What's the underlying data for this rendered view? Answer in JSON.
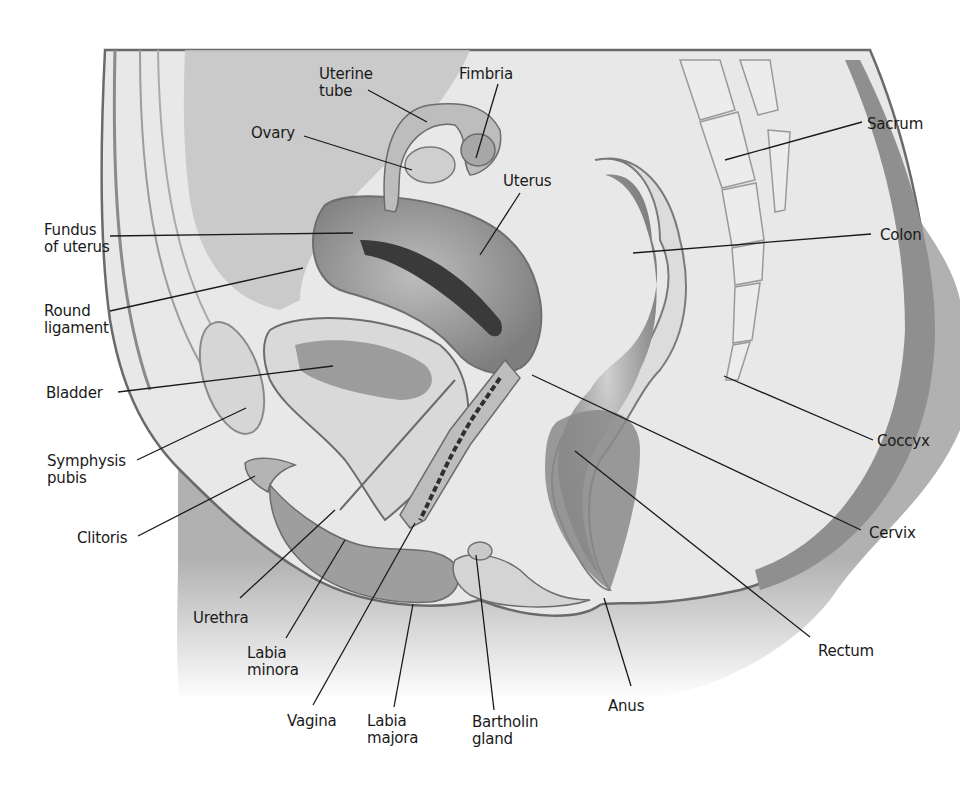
{
  "diagram": {
    "type": "anatomical-illustration",
    "colors": {
      "background": "#ffffff",
      "skin_dark": "#8f8f8f",
      "skin_mid": "#b5b5b5",
      "tissue_light": "#e6e6e6",
      "organ_mid": "#a9a9a9",
      "organ_dark": "#6f6f6f",
      "line": "#1a1a1a"
    },
    "labels": [
      {
        "id": "uterine-tube",
        "text": "Uterine\ntube",
        "x": 319,
        "y": 66,
        "align": "left",
        "line": [
          [
            368,
            90
          ],
          [
            427,
            122
          ]
        ]
      },
      {
        "id": "fimbria",
        "text": "Fimbria",
        "x": 459,
        "y": 66,
        "align": "left",
        "line": [
          [
            498,
            84
          ],
          [
            476,
            158
          ]
        ]
      },
      {
        "id": "ovary",
        "text": "Ovary",
        "x": 251,
        "y": 125,
        "align": "left",
        "line": [
          [
            304,
            136
          ],
          [
            412,
            170
          ]
        ]
      },
      {
        "id": "uterus",
        "text": "Uterus",
        "x": 503,
        "y": 173,
        "align": "left",
        "line": [
          [
            520,
            193
          ],
          [
            480,
            255
          ]
        ]
      },
      {
        "id": "sacrum",
        "text": "Sacrum",
        "x": 867,
        "y": 116,
        "align": "left",
        "line": [
          [
            862,
            122
          ],
          [
            725,
            160
          ]
        ]
      },
      {
        "id": "fundus-of-uterus",
        "text": "Fundus\nof uterus",
        "x": 44,
        "y": 222,
        "align": "left",
        "line": [
          [
            110,
            236
          ],
          [
            353,
            233
          ]
        ]
      },
      {
        "id": "colon",
        "text": "Colon",
        "x": 880,
        "y": 227,
        "align": "left",
        "line": [
          [
            871,
            234
          ],
          [
            633,
            253
          ]
        ]
      },
      {
        "id": "round-ligament",
        "text": "Round\nligament",
        "x": 44,
        "y": 303,
        "align": "left",
        "line": [
          [
            110,
            311
          ],
          [
            303,
            268
          ]
        ]
      },
      {
        "id": "bladder",
        "text": "Bladder",
        "x": 46,
        "y": 385,
        "align": "left",
        "line": [
          [
            118,
            392
          ],
          [
            333,
            366
          ]
        ]
      },
      {
        "id": "coccyx",
        "text": "Coccyx",
        "x": 877,
        "y": 433,
        "align": "left",
        "line": [
          [
            873,
            440
          ],
          [
            724,
            376
          ]
        ]
      },
      {
        "id": "symphysis-pubis",
        "text": "Symphysis\npubis",
        "x": 47,
        "y": 453,
        "align": "left",
        "line": [
          [
            137,
            460
          ],
          [
            246,
            408
          ]
        ]
      },
      {
        "id": "clitoris",
        "text": "Clitoris",
        "x": 77,
        "y": 530,
        "align": "left",
        "line": [
          [
            138,
            536
          ],
          [
            255,
            476
          ]
        ]
      },
      {
        "id": "cervix",
        "text": "Cervix",
        "x": 869,
        "y": 525,
        "align": "left",
        "line": [
          [
            861,
            530
          ],
          [
            532,
            375
          ]
        ]
      },
      {
        "id": "urethra",
        "text": "Urethra",
        "x": 193,
        "y": 610,
        "align": "left",
        "line": [
          [
            240,
            598
          ],
          [
            335,
            510
          ]
        ]
      },
      {
        "id": "labia-minora",
        "text": "Labia\nminora",
        "x": 247,
        "y": 645,
        "align": "left",
        "line": [
          [
            286,
            638
          ],
          [
            345,
            540
          ]
        ]
      },
      {
        "id": "rectum",
        "text": "Rectum",
        "x": 818,
        "y": 643,
        "align": "left",
        "line": [
          [
            810,
            637
          ],
          [
            575,
            451
          ]
        ]
      },
      {
        "id": "anus",
        "text": "Anus",
        "x": 608,
        "y": 698,
        "align": "left",
        "line": [
          [
            631,
            686
          ],
          [
            604,
            598
          ]
        ]
      },
      {
        "id": "vagina",
        "text": "Vagina",
        "x": 287,
        "y": 713,
        "align": "left",
        "line": [
          [
            313,
            705
          ],
          [
            415,
            523
          ]
        ]
      },
      {
        "id": "labia-majora",
        "text": "Labia\nmajora",
        "x": 367,
        "y": 713,
        "align": "left",
        "line": [
          [
            394,
            707
          ],
          [
            413,
            604
          ]
        ]
      },
      {
        "id": "bartholin-gland",
        "text": "Bartholin\ngland",
        "x": 472,
        "y": 714,
        "align": "left",
        "line": [
          [
            494,
            710
          ],
          [
            476,
            555
          ]
        ]
      }
    ]
  }
}
